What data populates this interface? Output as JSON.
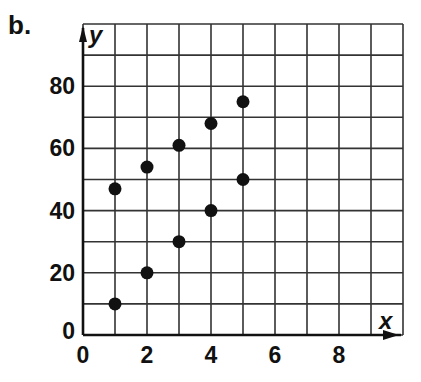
{
  "panel_label": "b.",
  "chart_data": {
    "type": "scatter",
    "title": "",
    "xlabel": "x",
    "ylabel": "y",
    "xlim": [
      0,
      10
    ],
    "ylim": [
      0,
      100
    ],
    "grid": true,
    "x_grid_step": 1,
    "y_grid_step": 10,
    "x_ticks": [
      0,
      2,
      4,
      6,
      8
    ],
    "y_ticks": [
      0,
      20,
      40,
      60,
      80
    ],
    "x_tick_labels": [
      "0",
      "2",
      "4",
      "6",
      "8"
    ],
    "y_tick_labels": [
      "0",
      "20",
      "40",
      "60",
      "80"
    ],
    "legend": null,
    "series": [
      {
        "name": "lower",
        "x": [
          1,
          2,
          3,
          4,
          5
        ],
        "y": [
          10,
          20,
          30,
          40,
          50
        ]
      },
      {
        "name": "upper",
        "x": [
          1,
          2,
          3,
          4,
          5
        ],
        "y": [
          47,
          54,
          61,
          68,
          75
        ]
      }
    ],
    "point_color": "#111111"
  }
}
